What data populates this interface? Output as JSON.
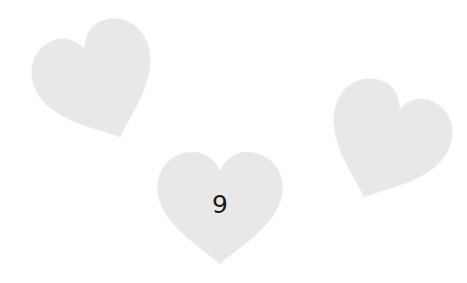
{
  "colors": {
    "background": "#ffffff",
    "heart_fill": "#e6e6e6",
    "heart_shade": "#dcdcdc",
    "label": "#1a1a1a"
  },
  "hearts": [
    {
      "id": "left",
      "label": "",
      "rotation_deg": -22
    },
    {
      "id": "center",
      "label": "9",
      "rotation_deg": 0
    },
    {
      "id": "right",
      "label": "",
      "rotation_deg": 22
    }
  ]
}
